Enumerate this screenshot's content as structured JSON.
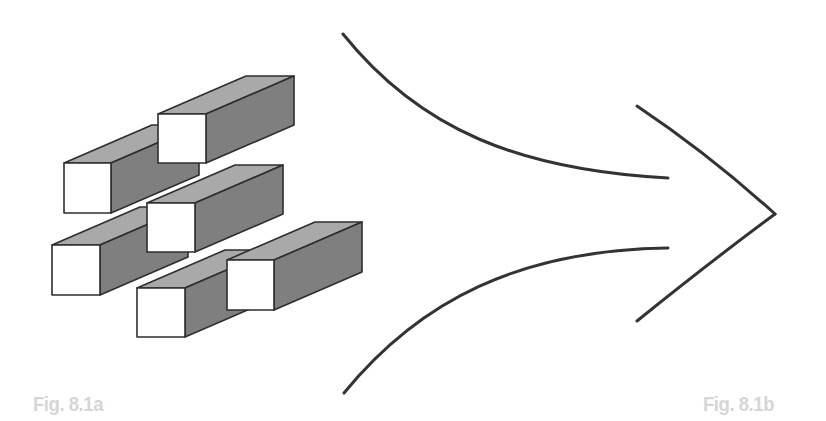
{
  "figure": {
    "left_label": "Fig. 8.1a",
    "right_label": "Fig. 8.1b"
  },
  "colors": {
    "background": "#ffffff",
    "front_face": "#ffffff",
    "top_face": "#a9a9a9",
    "side_face": "#7f7f7f",
    "outline": "#2e2e2e",
    "curve_stroke": "#333333",
    "label": "#d6d6d6"
  },
  "boxes": [
    {
      "id": "bar-top-left",
      "x": 64,
      "y": 163,
      "w": 47,
      "h": 50
    },
    {
      "id": "bar-top-right",
      "x": 158,
      "y": 114,
      "w": 48,
      "h": 49
    },
    {
      "id": "bar-middle-left",
      "x": 52,
      "y": 245,
      "w": 48,
      "h": 50
    },
    {
      "id": "bar-middle-right",
      "x": 147,
      "y": 203,
      "w": 48,
      "h": 49
    },
    {
      "id": "bar-bottom-left",
      "x": 137,
      "y": 288,
      "w": 48,
      "h": 49
    },
    {
      "id": "bar-bottom-right",
      "x": 227,
      "y": 260,
      "w": 47,
      "h": 50
    }
  ],
  "depth": {
    "dx": 88,
    "dy": -38
  },
  "curves": {
    "upper": "M343,34 C420,130 520,170 668,178",
    "lower": "M344,393 C420,300 520,250 668,248",
    "arrowhead_top": "M637,106 Q710,155 775,214",
    "arrowhead_bottom": "M775,214 Q710,262 637,321"
  }
}
